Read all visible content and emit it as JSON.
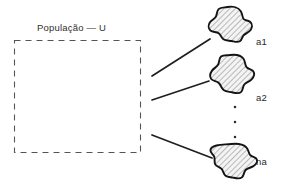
{
  "figure": {
    "title": "População — U",
    "background_color": "#ffffff",
    "stroke_color": "#1a1a1a",
    "hatch_color": "#6e6e6e",
    "fill_color": "#f2f2f2",
    "dash_color": "#555555",
    "set_box": {
      "label": "População — U",
      "x": 14,
      "y": 40,
      "width": 126,
      "height": 112,
      "style": "dashed"
    },
    "samples": [
      {
        "id": "a1",
        "label": "a1"
      },
      {
        "id": "a2",
        "label": "a2"
      },
      {
        "id": "na",
        "label": "na"
      }
    ],
    "ellipsis": {
      "dots": 3,
      "orientation": "vertical"
    },
    "connectors": [
      {
        "from": "set-box",
        "to": "a1"
      },
      {
        "from": "set-box",
        "to": "a2"
      },
      {
        "from": "set-box",
        "to": "na"
      }
    ]
  }
}
